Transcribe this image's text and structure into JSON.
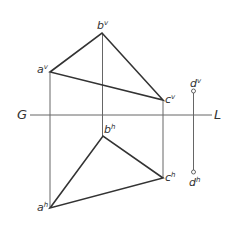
{
  "diagram": {
    "title": "",
    "ground_line": {
      "left_label": "G",
      "right_label": "L",
      "y": 115,
      "x1": 30,
      "x2": 212
    },
    "colors": {
      "edge": "#333333",
      "projector": "#666666",
      "text": "#333333"
    },
    "points": {
      "av": {
        "base": "a",
        "sup": "v",
        "x": 50,
        "y": 72
      },
      "bv": {
        "base": "b",
        "sup": "v",
        "x": 102,
        "y": 33
      },
      "cv": {
        "base": "c",
        "sup": "v",
        "x": 163,
        "y": 100
      },
      "dv": {
        "base": "d",
        "sup": "v",
        "x": 193,
        "y": 91
      },
      "ah": {
        "base": "a",
        "sup": "h",
        "x": 50,
        "y": 208
      },
      "bh": {
        "base": "b",
        "sup": "h",
        "x": 103,
        "y": 136
      },
      "ch": {
        "base": "c",
        "sup": "h",
        "x": 163,
        "y": 178
      },
      "dh": {
        "base": "d",
        "sup": "h",
        "x": 194,
        "y": 172
      }
    },
    "labels": {
      "av": "a",
      "av_sup": "v",
      "bv": "b",
      "bv_sup": "v",
      "cv": "c",
      "cv_sup": "v",
      "dv": "d",
      "dv_sup": "v",
      "ah": "a",
      "ah_sup": "h",
      "bh": "b",
      "bh_sup": "h",
      "ch": "c",
      "ch_sup": "h",
      "dh": "d",
      "dh_sup": "h"
    }
  }
}
